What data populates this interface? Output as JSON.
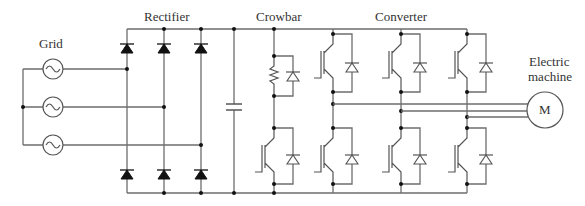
{
  "diagram": {
    "type": "power-electronics-circuit",
    "labels": {
      "grid": "Grid",
      "rectifier": "Rectifier",
      "crowbar": "Crowbar",
      "converter": "Converter",
      "machine_line1": "Electric",
      "machine_line2": "machine",
      "motor_symbol": "M"
    },
    "sections": [
      {
        "id": "grid",
        "label": "Grid",
        "components": [
          "ac-source",
          "ac-source",
          "ac-source"
        ]
      },
      {
        "id": "rectifier",
        "label": "Rectifier",
        "components": [
          "diode-bridge-3-phase"
        ]
      },
      {
        "id": "dc-link",
        "label": "",
        "components": [
          "capacitor"
        ]
      },
      {
        "id": "crowbar",
        "label": "Crowbar",
        "components": [
          "resistor",
          "diode",
          "igbt",
          "diode"
        ]
      },
      {
        "id": "converter",
        "label": "Converter",
        "components": [
          "igbt-leg",
          "igbt-leg",
          "igbt-leg"
        ]
      },
      {
        "id": "machine",
        "label": "Electric machine",
        "components": [
          "motor"
        ]
      }
    ],
    "colors": {
      "wire": "#6e6e6e",
      "node": "#111111",
      "text": "#333333"
    }
  }
}
